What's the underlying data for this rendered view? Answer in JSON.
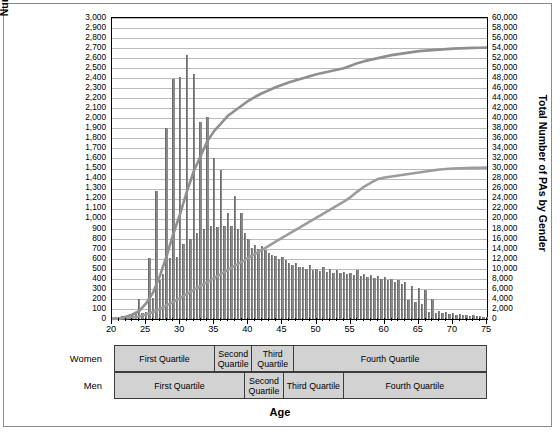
{
  "chart_data": {
    "type": "bar",
    "title": "",
    "xlabel": "Age",
    "ylabel": "Number of PAs by Age",
    "ylabel_secondary": "Total Number of PAs by Gender",
    "xlim": [
      20,
      75
    ],
    "ylim": [
      0,
      3000
    ],
    "ylim_secondary": [
      0,
      60000
    ],
    "grid": true,
    "legend_position": "none",
    "x_ticks_major": [
      20,
      25,
      30,
      35,
      40,
      45,
      50,
      55,
      60,
      65,
      70,
      75
    ],
    "y_ticks_left": [
      "0",
      "100",
      "200",
      "300",
      "400",
      "500",
      "600",
      "700",
      "800",
      "900",
      "1,000",
      "1,100",
      "1,200",
      "1,300",
      "1,400",
      "1,500",
      "1,600",
      "1,700",
      "1,800",
      "1,900",
      "2,000",
      "2,100",
      "2,200",
      "2,300",
      "2,400",
      "2,500",
      "2,600",
      "2,700",
      "2,800",
      "2,900",
      "3,000"
    ],
    "y_ticks_right": [
      "0",
      "2,000",
      "4,000",
      "6,000",
      "8,000",
      "10,000",
      "12,000",
      "14,000",
      "16,000",
      "18,000",
      "20,000",
      "22,000",
      "24,000",
      "26,000",
      "28,000",
      "30,000",
      "32,000",
      "34,000",
      "36,000",
      "38,000",
      "40,000",
      "42,000",
      "44,000",
      "46,000",
      "48,000",
      "50,000",
      "52,000",
      "54,000",
      "56,000",
      "58,000",
      "60,000"
    ],
    "ages": [
      20,
      21,
      22,
      23,
      24,
      25,
      26,
      27,
      28,
      29,
      30,
      31,
      32,
      33,
      34,
      35,
      36,
      37,
      38,
      39,
      40,
      41,
      42,
      43,
      44,
      45,
      46,
      47,
      48,
      49,
      50,
      51,
      52,
      53,
      54,
      55,
      56,
      57,
      58,
      59,
      60,
      61,
      62,
      63,
      64,
      65,
      66,
      67,
      68,
      69,
      70,
      71,
      72,
      73,
      74,
      75
    ],
    "series": [
      {
        "name": "Number of PAs by Age",
        "type": "bar",
        "values": [
          20,
          25,
          30,
          40,
          200,
          60,
          610,
          1280,
          1900,
          2390,
          2410,
          2630,
          2440,
          1960,
          2010,
          1750,
          1500,
          1430,
          1330,
          1200,
          1100,
          1000,
          940,
          900,
          870,
          850,
          830,
          800,
          790,
          770,
          760,
          740,
          720,
          700,
          680,
          660,
          640,
          620,
          600,
          590,
          570,
          560,
          540,
          520,
          500,
          480,
          460,
          440,
          420,
          400,
          380,
          360,
          340,
          320,
          300,
          280
        ]
      },
      {
        "name": "Women (cumulative)",
        "type": "line",
        "values": [
          40,
          110,
          420,
          900,
          1600,
          3100,
          5200,
          8500,
          12500,
          17000,
          21000,
          25500,
          29500,
          32500,
          35500,
          37500,
          39000,
          40500,
          41500,
          42500,
          43500,
          44300,
          45000,
          45600,
          46200,
          46700,
          47200,
          47600,
          48000,
          48400,
          48800,
          49100,
          49400,
          49700,
          50000,
          50500,
          51000,
          51400,
          51700,
          52000,
          52300,
          52600,
          52800,
          53000,
          53200,
          53400,
          53500,
          53600,
          53700,
          53800,
          53900,
          53950,
          54000,
          54050,
          54080,
          54100
        ]
      },
      {
        "name": "Men (cumulative)",
        "type": "line",
        "values": [
          20,
          60,
          150,
          300,
          500,
          900,
          1400,
          2000,
          2700,
          3400,
          4200,
          5000,
          5800,
          6600,
          7400,
          8200,
          9000,
          9800,
          10600,
          11400,
          12200,
          13000,
          13800,
          14600,
          15400,
          16200,
          17000,
          17800,
          18600,
          19400,
          20200,
          21000,
          21800,
          22600,
          23400,
          24300,
          25400,
          26400,
          27200,
          27900,
          28200,
          28400,
          28600,
          28800,
          29000,
          29200,
          29400,
          29600,
          29800,
          29900,
          30000,
          30050,
          30100,
          30130,
          30150,
          30170
        ]
      }
    ],
    "bar_color": "#8a8a8a",
    "line_color": "#8a8a8a"
  },
  "bar_values": [
    {
      "age": 20,
      "v": 15
    },
    {
      "age": 20.5,
      "v": 20
    },
    {
      "age": 21,
      "v": 25
    },
    {
      "age": 21.5,
      "v": 28
    },
    {
      "age": 22,
      "v": 30
    },
    {
      "age": 22.5,
      "v": 35
    },
    {
      "age": 23,
      "v": 45
    },
    {
      "age": 23.5,
      "v": 55
    },
    {
      "age": 24,
      "v": 200
    },
    {
      "age": 24.5,
      "v": 60
    },
    {
      "age": 25,
      "v": 70
    },
    {
      "age": 25.5,
      "v": 610
    },
    {
      "age": 26,
      "v": 210
    },
    {
      "age": 26.5,
      "v": 1280
    },
    {
      "age": 27,
      "v": 390
    },
    {
      "age": 27.5,
      "v": 450
    },
    {
      "age": 28,
      "v": 1900
    },
    {
      "age": 28.5,
      "v": 610
    },
    {
      "age": 29,
      "v": 2390
    },
    {
      "age": 29.5,
      "v": 620
    },
    {
      "age": 30,
      "v": 2410
    },
    {
      "age": 30.5,
      "v": 750
    },
    {
      "age": 31,
      "v": 2630
    },
    {
      "age": 31.5,
      "v": 800
    },
    {
      "age": 32,
      "v": 2440
    },
    {
      "age": 32.5,
      "v": 860
    },
    {
      "age": 33,
      "v": 1960
    },
    {
      "age": 33.5,
      "v": 900
    },
    {
      "age": 34,
      "v": 2010
    },
    {
      "age": 34.5,
      "v": 930
    },
    {
      "age": 35,
      "v": 1600
    },
    {
      "age": 35.5,
      "v": 920
    },
    {
      "age": 36,
      "v": 1490
    },
    {
      "age": 36.5,
      "v": 930
    },
    {
      "age": 37,
      "v": 1060
    },
    {
      "age": 37.5,
      "v": 930
    },
    {
      "age": 38,
      "v": 1230
    },
    {
      "age": 38.5,
      "v": 900
    },
    {
      "age": 39,
      "v": 1060
    },
    {
      "age": 39.5,
      "v": 860
    },
    {
      "age": 40,
      "v": 800
    },
    {
      "age": 40.5,
      "v": 710
    },
    {
      "age": 41,
      "v": 740
    },
    {
      "age": 41.5,
      "v": 700
    },
    {
      "age": 42,
      "v": 730
    },
    {
      "age": 42.5,
      "v": 690
    },
    {
      "age": 43,
      "v": 660
    },
    {
      "age": 43.5,
      "v": 640
    },
    {
      "age": 44,
      "v": 630
    },
    {
      "age": 44.5,
      "v": 600
    },
    {
      "age": 45,
      "v": 620
    },
    {
      "age": 45.5,
      "v": 590
    },
    {
      "age": 46,
      "v": 560
    },
    {
      "age": 46.5,
      "v": 540
    },
    {
      "age": 47,
      "v": 560
    },
    {
      "age": 47.5,
      "v": 520
    },
    {
      "age": 48,
      "v": 520
    },
    {
      "age": 48.5,
      "v": 500
    },
    {
      "age": 49,
      "v": 540
    },
    {
      "age": 49.5,
      "v": 490
    },
    {
      "age": 50,
      "v": 500
    },
    {
      "age": 50.5,
      "v": 480
    },
    {
      "age": 51,
      "v": 520
    },
    {
      "age": 51.5,
      "v": 470
    },
    {
      "age": 52,
      "v": 500
    },
    {
      "age": 52.5,
      "v": 460
    },
    {
      "age": 53,
      "v": 490
    },
    {
      "age": 53.5,
      "v": 460
    },
    {
      "age": 54,
      "v": 470
    },
    {
      "age": 54.5,
      "v": 450
    },
    {
      "age": 55,
      "v": 460
    },
    {
      "age": 55.5,
      "v": 440
    },
    {
      "age": 56,
      "v": 490
    },
    {
      "age": 56.5,
      "v": 430
    },
    {
      "age": 57,
      "v": 450
    },
    {
      "age": 57.5,
      "v": 420
    },
    {
      "age": 58,
      "v": 440
    },
    {
      "age": 58.5,
      "v": 410
    },
    {
      "age": 59,
      "v": 430
    },
    {
      "age": 59.5,
      "v": 400
    },
    {
      "age": 60,
      "v": 420
    },
    {
      "age": 60.5,
      "v": 390
    },
    {
      "age": 61,
      "v": 400
    },
    {
      "age": 61.5,
      "v": 370
    },
    {
      "age": 62,
      "v": 390
    },
    {
      "age": 62.5,
      "v": 350
    },
    {
      "age": 63,
      "v": 370
    },
    {
      "age": 63.5,
      "v": 190
    },
    {
      "age": 64,
      "v": 330
    },
    {
      "age": 64.5,
      "v": 170
    },
    {
      "age": 65,
      "v": 310
    },
    {
      "age": 65.5,
      "v": 150
    },
    {
      "age": 66,
      "v": 290
    },
    {
      "age": 66.5,
      "v": 70
    },
    {
      "age": 67,
      "v": 200
    },
    {
      "age": 67.5,
      "v": 60
    },
    {
      "age": 68,
      "v": 80
    },
    {
      "age": 68.5,
      "v": 55
    },
    {
      "age": 69,
      "v": 70
    },
    {
      "age": 69.5,
      "v": 50
    },
    {
      "age": 70,
      "v": 60
    },
    {
      "age": 70.5,
      "v": 45
    },
    {
      "age": 71,
      "v": 50
    },
    {
      "age": 71.5,
      "v": 40
    },
    {
      "age": 72,
      "v": 45
    },
    {
      "age": 72.5,
      "v": 35
    },
    {
      "age": 73,
      "v": 40
    },
    {
      "age": 73.5,
      "v": 30
    },
    {
      "age": 74,
      "v": 30
    },
    {
      "age": 74.5,
      "v": 25
    },
    {
      "age": 75,
      "v": 20
    }
  ],
  "quartiles": {
    "rows": [
      {
        "label": "Women",
        "cells": [
          {
            "text": "First Quartile",
            "start": 20,
            "end": 34.8
          },
          {
            "text": "Second Quartile",
            "start": 34.8,
            "end": 40.3
          },
          {
            "text": "Third Quartile",
            "start": 40.3,
            "end": 46.5
          },
          {
            "text": "Fourth Quartile",
            "start": 46.5,
            "end": 75
          }
        ]
      },
      {
        "label": "Men",
        "cells": [
          {
            "text": "First Quartile",
            "start": 20,
            "end": 39.2
          },
          {
            "text": "Second Quartile",
            "start": 39.2,
            "end": 45.0
          },
          {
            "text": "Third Quartile",
            "start": 45.0,
            "end": 53.8
          },
          {
            "text": "Fourth Quartile",
            "start": 53.8,
            "end": 75
          }
        ]
      }
    ]
  }
}
